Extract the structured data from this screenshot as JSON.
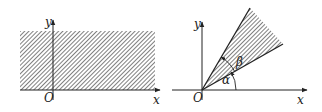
{
  "figures": [
    {
      "id": "left",
      "description": "Hatched region above x-axis (upper half-plane)",
      "labels": {
        "y_axis": "y",
        "x_axis": "x",
        "origin": "O"
      }
    },
    {
      "id": "right",
      "description": "Hatched angular sector between rays at angles alpha and beta",
      "labels": {
        "y_axis": "y",
        "x_axis": "x",
        "origin": "O",
        "angle_alpha": "α",
        "angle_beta": "β"
      }
    }
  ],
  "colors": {
    "stroke": "#222222",
    "hatch": "#444444",
    "background": "#ffffff"
  }
}
